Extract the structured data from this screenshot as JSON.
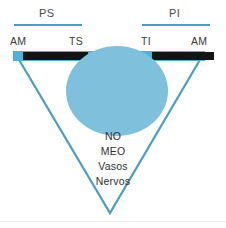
{
  "figure": {
    "colors": {
      "strip_blue": "#4fb3d9",
      "disc_blue": "#7fc0dd",
      "line_blue": "#4a9ec4",
      "bar_black": "#141414",
      "text_gray": "#3a3a3a",
      "background": "#ffffff"
    },
    "group_labels": [
      {
        "id": "ps",
        "text": "PS"
      },
      {
        "id": "pi",
        "text": "PI"
      }
    ],
    "anatomic_labels": [
      {
        "id": "am-left",
        "text": "AM"
      },
      {
        "id": "ts",
        "text": "TS"
      },
      {
        "id": "ti",
        "text": "TI"
      },
      {
        "id": "am-right",
        "text": "AM"
      }
    ],
    "insertion_bars": [
      {
        "id": "bar-left",
        "text": ""
      },
      {
        "id": "bar-right",
        "text": ""
      }
    ],
    "center_labels": [
      {
        "id": "no",
        "text": "NO"
      },
      {
        "id": "meo",
        "text": "MEO"
      },
      {
        "id": "vasos",
        "text": "Vasos"
      },
      {
        "id": "nervos",
        "text": "Nervos"
      }
    ]
  }
}
